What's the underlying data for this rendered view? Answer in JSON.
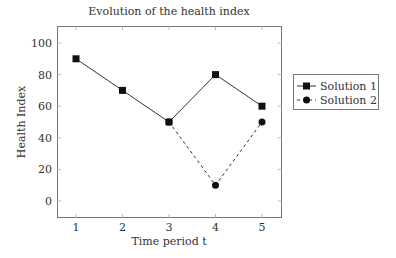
{
  "chart_data": {
    "type": "line",
    "title": "Evolution of the health index",
    "xlabel": "Time period t",
    "ylabel": "Health Index",
    "x": [
      1,
      2,
      3,
      4,
      5
    ],
    "series": [
      {
        "name": "Solution 1",
        "values": [
          90,
          70,
          50,
          80,
          60
        ],
        "marker": "square",
        "line": "solid"
      },
      {
        "name": "Solution 2",
        "values": [
          null,
          null,
          50,
          10,
          50
        ],
        "marker": "circle",
        "line": "dashed"
      }
    ],
    "xticks": [
      "1",
      "2",
      "3",
      "4",
      "5"
    ],
    "yticks": [
      "0",
      "20",
      "40",
      "60",
      "80",
      "100"
    ],
    "xlim": [
      0.6,
      5.4
    ],
    "ylim": [
      -10,
      110
    ],
    "grid": false,
    "legend_position": "outer right"
  }
}
